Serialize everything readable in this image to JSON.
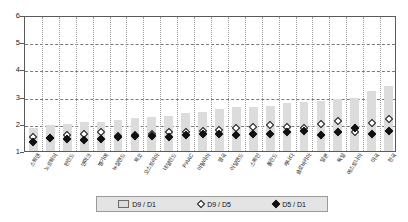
{
  "chart_data": {
    "type": "bar",
    "title": "",
    "subtitle": "",
    "xlabel": "",
    "ylabel": "",
    "ylim": [
      1,
      6
    ],
    "yticks": [
      1,
      2,
      3,
      4,
      5,
      6
    ],
    "grid": true,
    "legend_position": "bottom",
    "categories": [
      "스웨덴",
      "노르웨이",
      "핀란드",
      "덴마크",
      "벨기에",
      "뉴질랜드",
      "체코",
      "오스트리아",
      "네덜란드",
      "PIAAC",
      "이탈리아",
      "영국",
      "아일랜드",
      "스페인",
      "폴란드",
      "캐나다",
      "슬로바키아",
      "일본",
      "독일",
      "에스토니아",
      "미국",
      "한국"
    ],
    "series": [
      {
        "name": "D9 / D1",
        "marker": "bar",
        "values": [
          1.85,
          1.95,
          2.0,
          2.05,
          2.05,
          2.15,
          2.2,
          2.25,
          2.3,
          2.4,
          2.45,
          2.55,
          2.6,
          2.6,
          2.65,
          2.75,
          2.8,
          2.85,
          2.9,
          2.95,
          3.2,
          3.4
        ]
      },
      {
        "name": "D9 / D5",
        "marker": "open-diamond",
        "values": [
          1.62,
          1.6,
          1.7,
          1.72,
          1.8,
          1.68,
          1.7,
          1.75,
          1.8,
          1.82,
          1.85,
          1.88,
          1.95,
          2.0,
          2.05,
          2.0,
          1.95,
          2.1,
          2.2,
          1.8,
          2.15,
          2.3
        ]
      },
      {
        "name": "D5 / D1",
        "marker": "filled-diamond",
        "values": [
          1.45,
          1.58,
          1.55,
          1.5,
          1.55,
          1.62,
          1.68,
          1.65,
          1.62,
          1.7,
          1.72,
          1.75,
          1.7,
          1.75,
          1.72,
          1.8,
          1.85,
          1.7,
          1.8,
          1.95,
          1.75,
          1.85
        ]
      }
    ]
  },
  "legend": {
    "items": [
      {
        "label": "D9 / D1",
        "marker": "bar"
      },
      {
        "label": "D9 / D5",
        "marker": "open-diamond"
      },
      {
        "label": "D5 / D1",
        "marker": "filled-diamond"
      }
    ]
  }
}
